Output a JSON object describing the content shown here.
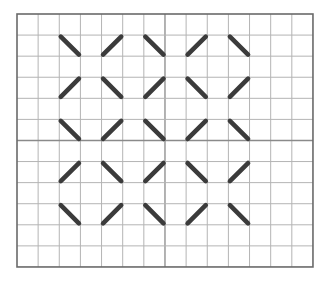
{
  "grid": {
    "cols": 14,
    "rows": 12,
    "origin_x": 17,
    "origin_y": 14,
    "cell": 21.14,
    "cell_h": 21.08,
    "center_col": 7,
    "center_row": 6,
    "colors": {
      "grid_line": "#b4b4b4",
      "center_line": "#8a8a8a",
      "border": "#6a6a6a",
      "stroke": "#3b3b3b",
      "background": "#ffffff"
    }
  },
  "strokes": {
    "start_cols": [
      2,
      4,
      6,
      8,
      10
    ],
    "start_rows": [
      1,
      3,
      5,
      7,
      9
    ],
    "pattern": [
      [
        "\\",
        "/",
        "\\",
        "/",
        "\\"
      ],
      [
        "/",
        "\\",
        "/",
        "\\",
        "/"
      ],
      [
        "\\",
        "/",
        "\\",
        "/",
        "\\"
      ],
      [
        "/",
        "\\",
        "/",
        "\\",
        "/"
      ],
      [
        "\\",
        "/",
        "\\",
        "/",
        "\\"
      ]
    ]
  }
}
